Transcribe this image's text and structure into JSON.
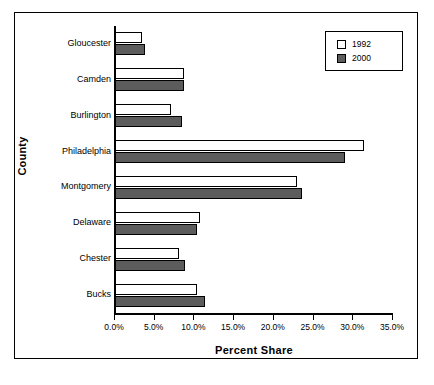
{
  "chart_data": {
    "type": "bar",
    "orientation": "horizontal",
    "title": "",
    "xlabel": "Percent Share",
    "ylabel": "County",
    "categories": [
      "Gloucester",
      "Camden",
      "Burlington",
      "Philadelphia",
      "Montgomery",
      "Delaware",
      "Chester",
      "Bucks"
    ],
    "series": [
      {
        "name": "1992",
        "color": "#ffffff",
        "values": [
          3.4,
          8.7,
          7.1,
          31.3,
          22.9,
          10.7,
          8.1,
          10.3
        ]
      },
      {
        "name": "2000",
        "color": "#5c5c5c",
        "values": [
          3.8,
          8.7,
          8.4,
          28.9,
          23.5,
          10.3,
          8.8,
          11.3
        ]
      }
    ],
    "xlim": [
      0,
      35
    ],
    "xticks": [
      0,
      5,
      10,
      15,
      20,
      25,
      30,
      35
    ],
    "xtick_labels": [
      "0.0%",
      "5.0%",
      "10.0%",
      "15.0%",
      "20.0%",
      "25.0%",
      "30.0%",
      "35.0%"
    ],
    "grid": false,
    "legend_position": "top-right",
    "legend_entries": [
      "1992",
      "2000"
    ]
  }
}
